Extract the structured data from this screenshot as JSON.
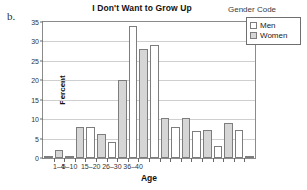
{
  "panel_letter": "b.",
  "legend": {
    "title": "Gender Code",
    "items": [
      {
        "label": "Men",
        "swatch": "men"
      },
      {
        "label": "Women",
        "swatch": "women"
      }
    ]
  },
  "chart_data": {
    "type": "bar",
    "title": "I Don't Want to Grow Up",
    "xlabel": "Age",
    "ylabel": "Percent",
    "ylim": [
      0,
      35
    ],
    "yticks": [
      0,
      5,
      10,
      15,
      20,
      25,
      30,
      35
    ],
    "grid": true,
    "legend_position": "outside-right",
    "xtick_labels": [
      "1–4",
      "5–10",
      "15–20",
      "26–30",
      "36–40"
    ],
    "xtick_label_positions": [
      1,
      2,
      4,
      6,
      8
    ],
    "bars": [
      {
        "index": 0,
        "group": "0",
        "series": "Women",
        "value": 0.3
      },
      {
        "index": 1,
        "group": "1–4",
        "series": "Women",
        "value": 2.0
      },
      {
        "index": 2,
        "group": "1–4",
        "series": "Men",
        "value": 0.2
      },
      {
        "index": 3,
        "group": "5–10",
        "series": "Women",
        "value": 8.0
      },
      {
        "index": 4,
        "group": "5–10",
        "series": "Men",
        "value": 8.0
      },
      {
        "index": 5,
        "group": "11–14",
        "series": "Women",
        "value": 6.2
      },
      {
        "index": 6,
        "group": "11–14",
        "series": "Men",
        "value": 4.2
      },
      {
        "index": 7,
        "group": "15–20",
        "series": "Women",
        "value": 20.0
      },
      {
        "index": 8,
        "group": "15–20",
        "series": "Men",
        "value": 34.0
      },
      {
        "index": 9,
        "group": "21–25",
        "series": "Women",
        "value": 28.0
      },
      {
        "index": 10,
        "group": "21–25",
        "series": "Men",
        "value": 29.0
      },
      {
        "index": 11,
        "group": "26–30",
        "series": "Women",
        "value": 10.2
      },
      {
        "index": 12,
        "group": "26–30",
        "series": "Men",
        "value": 8.0
      },
      {
        "index": 13,
        "group": "31–35",
        "series": "Women",
        "value": 10.2
      },
      {
        "index": 14,
        "group": "31–35",
        "series": "Men",
        "value": 7.0
      },
      {
        "index": 15,
        "group": "36–40",
        "series": "Women",
        "value": 7.2
      },
      {
        "index": 16,
        "group": "36–40",
        "series": "Men",
        "value": 3.1
      },
      {
        "index": 17,
        "group": "41–45",
        "series": "Women",
        "value": 9.1
      },
      {
        "index": 18,
        "group": "41–45",
        "series": "Men",
        "value": 7.2
      },
      {
        "index": 19,
        "group": "46+",
        "series": "Men",
        "value": 0.3
      }
    ],
    "series_colors": {
      "Men": "#ffffff",
      "Women": "#d6d6d6"
    }
  }
}
